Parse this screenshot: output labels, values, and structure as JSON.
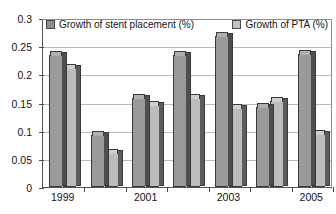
{
  "chart_data": {
    "type": "bar",
    "title": "",
    "subtitle": "",
    "xlabel": "",
    "ylabel": "",
    "categories": [
      "1999",
      "2000",
      "2001",
      "2002",
      "2003",
      "2004",
      "2005"
    ],
    "visible_tick_labels": [
      "1999",
      "2001",
      "2003",
      "2005"
    ],
    "series": [
      {
        "name": "Growth of stent placement (%)",
        "color": "#9a9a9a",
        "values": [
          0.235,
          0.093,
          0.158,
          0.234,
          0.268,
          0.142,
          0.237
        ]
      },
      {
        "name": "Growth of PTA (%)",
        "color": "#bcbcbc",
        "values": [
          0.211,
          0.061,
          0.146,
          0.158,
          0.141,
          0.152,
          0.094
        ]
      }
    ],
    "ylim": [
      0,
      0.3
    ],
    "ytick_labels": [
      "0",
      "0.05",
      "0.1",
      "0.15",
      "0.2",
      "0.25",
      "0.3"
    ],
    "ytick_values": [
      0,
      0.05,
      0.1,
      0.15,
      0.2,
      0.25,
      0.3
    ],
    "grid": true,
    "grid_axis": "y",
    "legend_position": "top-inside",
    "plot_background": "#ffffff",
    "gridline_color": "#b9b9b9",
    "axis_color": "#555555"
  },
  "legend": {
    "items": [
      {
        "label": "Growth of stent placement (%)",
        "swatch": "sw-stent"
      },
      {
        "label": "Growth of PTA (%)",
        "swatch": "sw-pta"
      }
    ]
  }
}
